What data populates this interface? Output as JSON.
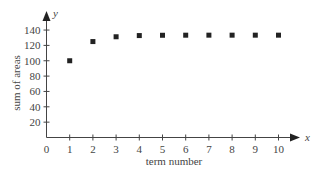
{
  "chart_data": {
    "type": "scatter",
    "title": "",
    "xlabel": "term number",
    "ylabel": "sum of areas",
    "x_axis_letter": "x",
    "y_axis_letter": "y",
    "x": [
      1,
      2,
      3,
      4,
      5,
      6,
      7,
      8,
      9,
      10
    ],
    "values": [
      100,
      125,
      131.25,
      132.81,
      133.2,
      133.3,
      133.33,
      133.33,
      133.33,
      133.33
    ],
    "x_ticks": [
      0,
      1,
      2,
      3,
      4,
      5,
      6,
      7,
      8,
      9,
      10
    ],
    "y_ticks": [
      20,
      40,
      60,
      80,
      100,
      120,
      140
    ],
    "xlim": [
      0,
      11
    ],
    "ylim": [
      0,
      150
    ],
    "grid": false,
    "legend": null,
    "marker": "square",
    "marker_color": "#222222",
    "axis_color": "#444444"
  }
}
